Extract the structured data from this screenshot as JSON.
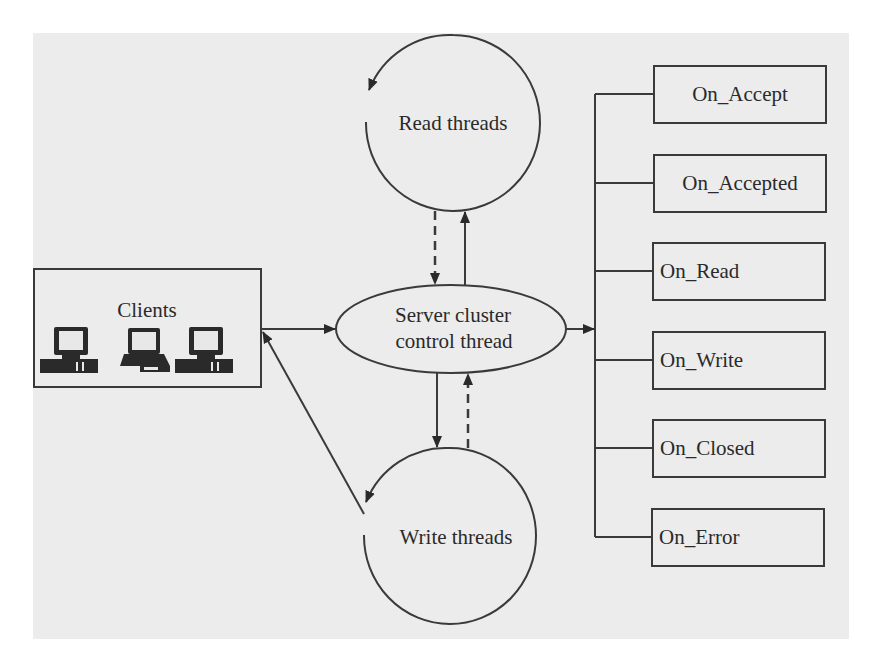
{
  "diagram": {
    "nodes": {
      "clients": {
        "label": "Clients",
        "icons": [
          "desktop-computer",
          "laptop-computer",
          "desktop-computer"
        ]
      },
      "read_threads": {
        "label": "Read threads"
      },
      "server": {
        "line1": "Server cluster",
        "line2": "control thread"
      },
      "write_threads": {
        "label": "Write threads"
      }
    },
    "handlers": [
      {
        "label": "On_Accept"
      },
      {
        "label": "On_Accepted"
      },
      {
        "label": "On_Read"
      },
      {
        "label": "On_Write"
      },
      {
        "label": "On_Closed"
      },
      {
        "label": "On_Error"
      }
    ],
    "edges": [
      {
        "from": "clients",
        "to": "server",
        "style": "solid"
      },
      {
        "from": "read_threads",
        "to": "server",
        "style": "dashed"
      },
      {
        "from": "server",
        "to": "read_threads",
        "style": "solid"
      },
      {
        "from": "server",
        "to": "write_threads",
        "style": "solid"
      },
      {
        "from": "write_threads",
        "to": "server",
        "style": "dashed"
      },
      {
        "from": "write_threads",
        "to": "clients",
        "style": "solid"
      },
      {
        "from": "server",
        "to": "handlers",
        "style": "solid"
      },
      {
        "from": "read_threads",
        "to": "read_threads",
        "style": "loop"
      },
      {
        "from": "write_threads",
        "to": "write_threads",
        "style": "loop"
      }
    ],
    "colors": {
      "stroke": "#3a3a3a",
      "panel": "#ececec",
      "text": "#2a2a2a"
    }
  }
}
